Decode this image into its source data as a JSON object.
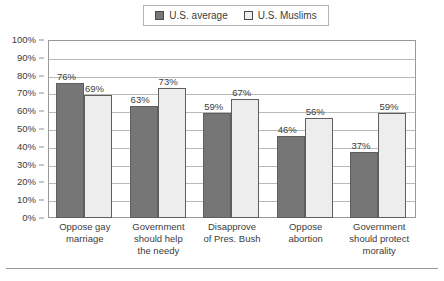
{
  "legend": {
    "entries": [
      {
        "label": "U.S. average",
        "swatch": "dark-gray-swatch-icon",
        "color": "#767676"
      },
      {
        "label": "U.S. Muslims",
        "swatch": "light-gray-swatch-icon",
        "color": "#ededed"
      }
    ]
  },
  "axis": {
    "y_ticks": [
      "0%",
      "10%",
      "20%",
      "30%",
      "40%",
      "50%",
      "60%",
      "70%",
      "80%",
      "90%",
      "100%"
    ]
  },
  "bar_labels": {
    "g0s0": "76%",
    "g0s1": "69%",
    "g1s0": "63%",
    "g1s1": "73%",
    "g2s0": "59%",
    "g2s1": "67%",
    "g3s0": "46%",
    "g3s1": "56%",
    "g4s0": "37%",
    "g4s1": "59%"
  },
  "categories_display": [
    "Oppose gay\nmarriage",
    "Government\nshould help\nthe needy",
    "Disapprove\nof Pres. Bush",
    "Oppose\nabortion",
    "Government\nshould protect\nmorality"
  ],
  "chart_data": {
    "type": "bar",
    "title": "",
    "subtitle": "",
    "xlabel": "",
    "ylabel": "",
    "ylim": [
      0,
      100
    ],
    "ytick_step": 10,
    "ytick_labels": [
      "0%",
      "10%",
      "20%",
      "30%",
      "40%",
      "50%",
      "60%",
      "70%",
      "80%",
      "90%",
      "100%"
    ],
    "grid": true,
    "grid_axis": "y",
    "legend_position": "top-center",
    "value_labels": true,
    "value_label_suffix": "%",
    "categories": [
      "Oppose gay marriage",
      "Government should help the needy",
      "Disapprove of Pres. Bush",
      "Oppose abortion",
      "Government should protect morality"
    ],
    "series": [
      {
        "name": "U.S. average",
        "color": "#767676",
        "values": [
          76,
          63,
          59,
          46,
          37
        ]
      },
      {
        "name": "U.S. Muslims",
        "color": "#ededed",
        "values": [
          69,
          73,
          67,
          56,
          59
        ]
      }
    ]
  }
}
